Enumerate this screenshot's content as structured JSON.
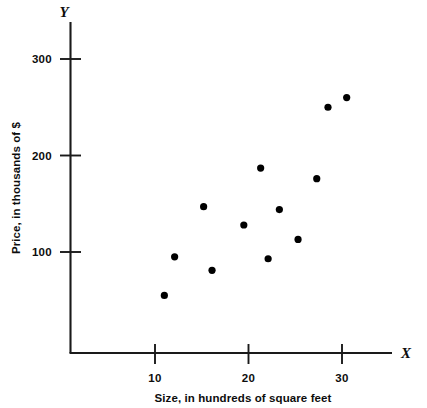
{
  "chart_data": {
    "type": "scatter",
    "title": "",
    "xlabel": "Size, in hundreds of square feet",
    "ylabel": "Price, in thousands of $",
    "x_axis_letter": "X",
    "y_axis_letter": "Y",
    "xlim": [
      0,
      35
    ],
    "ylim": [
      0,
      330
    ],
    "xticks": [
      10,
      20,
      30
    ],
    "xtick_labels": [
      "10",
      "20",
      "30"
    ],
    "yticks": [
      100,
      200,
      300
    ],
    "ytick_labels": [
      "100",
      "200",
      "300"
    ],
    "grid": false,
    "legend": null,
    "marker_color": "#000000",
    "axis_color": "#1a1a1a",
    "points": [
      {
        "x": 11.0,
        "y": 55
      },
      {
        "x": 12.1,
        "y": 95
      },
      {
        "x": 15.2,
        "y": 147
      },
      {
        "x": 16.1,
        "y": 81
      },
      {
        "x": 19.5,
        "y": 128
      },
      {
        "x": 21.3,
        "y": 187
      },
      {
        "x": 22.1,
        "y": 93
      },
      {
        "x": 23.3,
        "y": 144
      },
      {
        "x": 25.3,
        "y": 113
      },
      {
        "x": 27.3,
        "y": 176
      },
      {
        "x": 28.5,
        "y": 250
      },
      {
        "x": 30.5,
        "y": 260
      }
    ]
  }
}
